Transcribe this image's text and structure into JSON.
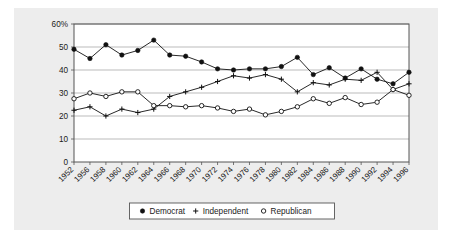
{
  "figure": {
    "background_color": "#ededed",
    "plot_background_color": "#ffffff",
    "frame_color": "#555555",
    "gridline_color": "#aaaaaa"
  },
  "chart_data": {
    "type": "line",
    "title": "",
    "subtitle": "",
    "xlabel": "",
    "ylabel": "",
    "grid": "horizontal",
    "legend_position": "bottom",
    "ylim": [
      0,
      60
    ],
    "yticks": [
      0,
      10,
      20,
      30,
      40,
      50,
      60
    ],
    "ytick_labels": [
      "0",
      "10",
      "20",
      "30",
      "40",
      "50",
      "60%"
    ],
    "categories": [
      "1952",
      "1956",
      "1958",
      "1960",
      "1962",
      "1964",
      "1966",
      "1968",
      "1970",
      "1972",
      "1974",
      "1976",
      "1978",
      "1980",
      "1982",
      "1984",
      "1986",
      "1988",
      "1990",
      "1992",
      "1994",
      "1996"
    ],
    "x": [
      1952,
      1956,
      1958,
      1960,
      1962,
      1964,
      1966,
      1968,
      1970,
      1972,
      1974,
      1976,
      1978,
      1980,
      1982,
      1984,
      1986,
      1988,
      1990,
      1992,
      1994,
      1996
    ],
    "series": [
      {
        "name": "Democrat",
        "marker": "filled-circle",
        "color": "#111111",
        "values": [
          49.0,
          45.0,
          51.0,
          46.5,
          48.5,
          53.0,
          46.5,
          46.0,
          43.5,
          40.5,
          40.0,
          40.5,
          40.5,
          41.5,
          45.5,
          38.0,
          41.0,
          36.5,
          40.5,
          36.0,
          34.0,
          39.0
        ]
      },
      {
        "name": "Independent",
        "marker": "plus",
        "color": "#111111",
        "values": [
          22.5,
          24.0,
          20.0,
          23.0,
          21.5,
          23.0,
          28.5,
          30.5,
          32.5,
          35.0,
          37.5,
          36.5,
          38.0,
          36.0,
          30.5,
          34.5,
          33.5,
          36.0,
          35.5,
          39.0,
          31.5,
          34.0
        ]
      },
      {
        "name": "Republican",
        "marker": "open-circle",
        "color": "#111111",
        "values": [
          27.5,
          30.0,
          28.5,
          30.5,
          30.5,
          24.5,
          24.5,
          24.0,
          24.5,
          23.5,
          22.0,
          23.0,
          20.5,
          22.0,
          24.0,
          27.5,
          25.5,
          28.0,
          25.0,
          26.0,
          31.5,
          29.0
        ]
      }
    ],
    "legend": [
      {
        "label": "Democrat",
        "marker": "filled-circle"
      },
      {
        "label": "Independent",
        "marker": "plus"
      },
      {
        "label": "Republican",
        "marker": "open-circle"
      }
    ]
  }
}
